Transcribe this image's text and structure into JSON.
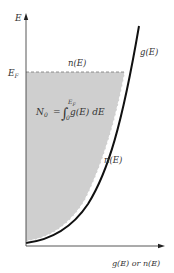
{
  "diagram": {
    "type": "density-of-states",
    "axes": {
      "y_label": "E",
      "x_label": "g(E) or n(E)",
      "fermi_level_label": "E",
      "fermi_level_subscript": "F"
    },
    "curves": {
      "g_label": "g(E)",
      "n_top_label": "n(E)",
      "n_side_label": "n(E)"
    },
    "formula": {
      "lhs": "N",
      "lhs_sub": "0",
      "equals": "=",
      "integral": "∫",
      "lower": "0",
      "upper": "E",
      "upper_sub": "F",
      "integrand": "g(E) dE"
    },
    "colors": {
      "fill": "#cfcfcf",
      "curve": "#111111",
      "axis": "#444444",
      "dash": "#777777"
    }
  }
}
